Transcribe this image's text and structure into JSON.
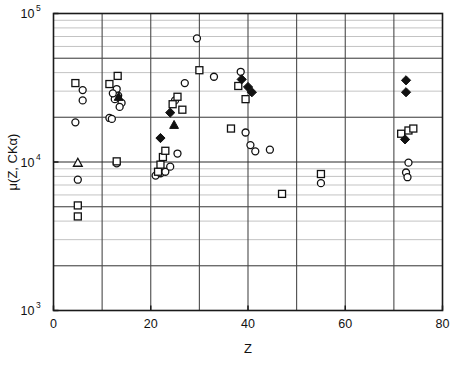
{
  "chart_data": {
    "type": "scatter",
    "title": "",
    "xlabel": "Z",
    "ylabel": "μ(Z, CKα)",
    "xlim": [
      0,
      80
    ],
    "ylim": [
      1000,
      100000
    ],
    "yscale": "log",
    "xscale": "linear",
    "grid": true,
    "legend_position": "none",
    "xticks": [
      0,
      20,
      40,
      60,
      80
    ],
    "xticklabels": [
      "0",
      "20",
      "40",
      "60",
      "80"
    ],
    "x_minor_gridlines": [
      10,
      30,
      50,
      70
    ],
    "yticks": [
      1000,
      10000,
      100000
    ],
    "yticklabels": [
      "10³",
      "10⁴",
      "10⁵"
    ],
    "ytick_mantissas": [
      "10",
      "10",
      "10"
    ],
    "ytick_exponents": [
      "3",
      "4",
      "5"
    ],
    "series": [
      {
        "name": "open-circle",
        "marker": "open-circle",
        "points": [
          [
            4.5,
            18500
          ],
          [
            6.0,
            30500
          ],
          [
            6.0,
            26000
          ],
          [
            5.0,
            7600
          ],
          [
            11.5,
            19800
          ],
          [
            12.0,
            19500
          ],
          [
            13.0,
            31000
          ],
          [
            13.3,
            28000
          ],
          [
            12.6,
            26500
          ],
          [
            14.0,
            25000
          ],
          [
            13.6,
            23500
          ],
          [
            12.2,
            29000
          ],
          [
            13.0,
            9800
          ],
          [
            21.0,
            8100
          ],
          [
            22.0,
            8400
          ],
          [
            23.0,
            8600
          ],
          [
            24.0,
            9300
          ],
          [
            25.5,
            11400
          ],
          [
            25.0,
            26000
          ],
          [
            29.5,
            68000
          ],
          [
            27.0,
            34000
          ],
          [
            33.0,
            37500
          ],
          [
            38.5,
            40500
          ],
          [
            39.5,
            15800
          ],
          [
            40.5,
            13000
          ],
          [
            41.5,
            11800
          ],
          [
            44.5,
            12100
          ],
          [
            55.0,
            7200
          ],
          [
            73.0,
            9900
          ],
          [
            72.5,
            8500
          ],
          [
            72.8,
            7900
          ]
        ]
      },
      {
        "name": "open-square",
        "marker": "open-square",
        "points": [
          [
            5.0,
            5100
          ],
          [
            5.0,
            4300
          ],
          [
            4.5,
            34000
          ],
          [
            11.5,
            33500
          ],
          [
            13.2,
            38000
          ],
          [
            13.0,
            10100
          ],
          [
            21.5,
            8600
          ],
          [
            22.0,
            9600
          ],
          [
            22.5,
            10800
          ],
          [
            23.0,
            11900
          ],
          [
            24.5,
            24500
          ],
          [
            25.5,
            27500
          ],
          [
            26.5,
            22500
          ],
          [
            30.0,
            41500
          ],
          [
            36.5,
            16800
          ],
          [
            38.0,
            32500
          ],
          [
            39.5,
            26500
          ],
          [
            47.0,
            6100
          ],
          [
            55.0,
            8300
          ],
          [
            71.5,
            15500
          ],
          [
            73.0,
            16300
          ],
          [
            74.0,
            16800
          ]
        ]
      },
      {
        "name": "filled-diamond",
        "marker": "filled-diamond",
        "points": [
          [
            24.0,
            21500
          ],
          [
            22.0,
            14500
          ],
          [
            38.7,
            36000
          ],
          [
            40.0,
            32000
          ],
          [
            40.8,
            29500
          ],
          [
            72.5,
            35500
          ],
          [
            72.5,
            29500
          ],
          [
            72.3,
            14200
          ]
        ]
      },
      {
        "name": "filled-triangle",
        "marker": "filled-triangle",
        "points": [
          [
            13.4,
            27500
          ],
          [
            24.8,
            17800
          ]
        ]
      },
      {
        "name": "open-triangle",
        "marker": "open-triangle",
        "points": [
          [
            5.0,
            9900
          ]
        ]
      }
    ]
  },
  "colors": {
    "axis": "#1a1a1a",
    "grid_major": "#4a4a4a",
    "grid_minor": "#b4b4b4",
    "marker": "#111111",
    "background": "#ffffff"
  }
}
